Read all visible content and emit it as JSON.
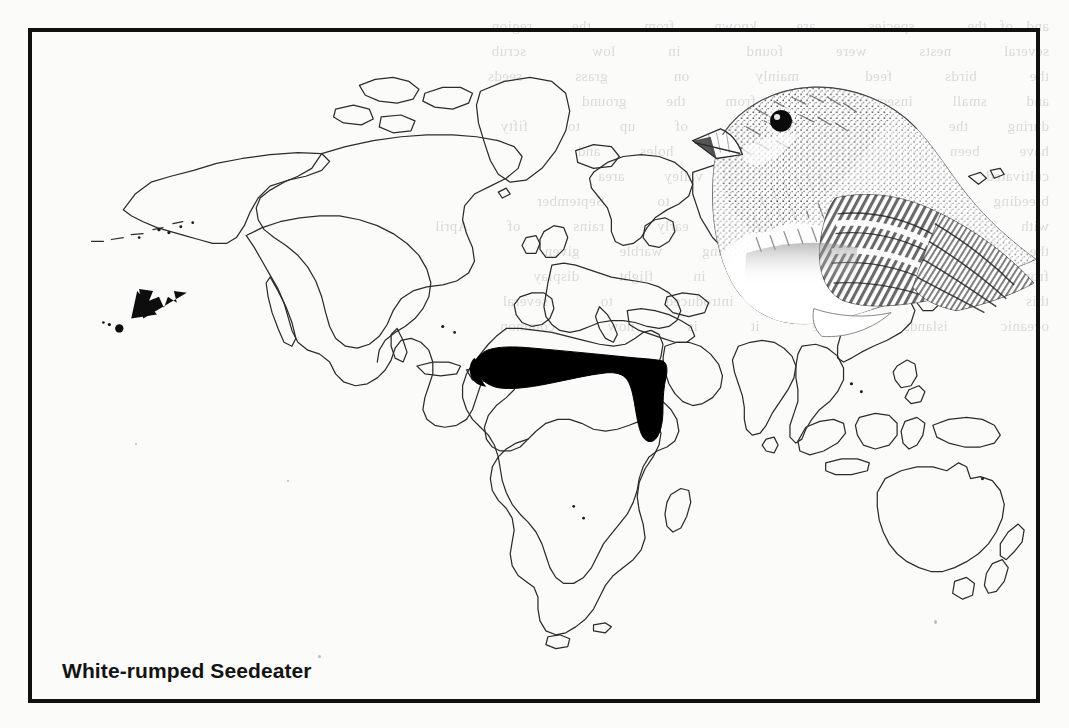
{
  "figure": {
    "caption": "White-rumped Seedeater",
    "type": "species-distribution-map",
    "projection": "world-equirectangular-outline",
    "frame_color": "#111111",
    "paper_color": "#fbfbfa",
    "coastline_color": "#2b2b2b",
    "range_fill_color": "#000000"
  },
  "legend": {
    "range_description": "Solid black band = breeding/resident range across the African Sahel, from the West African coast east to the Red Sea and south into the Ethiopian highlands.",
    "arrow_description": "Arrow indicating introduced population on the Hawaiian Islands.",
    "arrow_label": "",
    "introduced_marker_label": ""
  },
  "illustration": {
    "subject": "White-rumped Seedeater",
    "medium": "pen-and-ink stipple drawing",
    "view": "perched bird, head and folded wing, facing left",
    "position": "upper right of the map plate"
  },
  "bleed_text": {
    "line_1": "and of the    species    are   known   from    the   region",
    "line_2": "several    nests    were    found     in    low     scrub",
    "line_3": "the    birds    feed     mainly     on     grass    seeds",
    "line_4": "and   small   insects   taken   from   the   ground",
    "line_5": "during   the   dry   season   flocks   of   up   to   fifty",
    "line_6": "have   been   recorded   near   water   holes   and",
    "line_7": "cultivated   fields   throughout   the   valley   area",
    "line_8": "breeding    occurs    from    March    to    September",
    "line_9": "with    a    peak    in    the    early    rains    of   April",
    "line_10": "the   song   is   a   rapid   jingling   warble   given",
    "line_11": "from   an   exposed   perch   or   in   flight   display",
    "line_12": "this    form    has    been    introduced    to    several",
    "line_13": "oceanic    islands    where    it    is    now    common"
  }
}
